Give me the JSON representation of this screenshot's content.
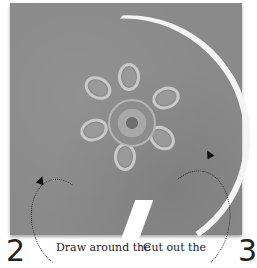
{
  "page": {
    "figure": "embroidered felt flower with circular cut line",
    "steps": [
      {
        "number": "2",
        "caption": "Draw around the"
      },
      {
        "number": "3",
        "caption": "Cut out the"
      }
    ]
  },
  "colors": {
    "felt": "#8a8a8a",
    "cut_line": "#f4f4f4",
    "text": "#222222"
  }
}
